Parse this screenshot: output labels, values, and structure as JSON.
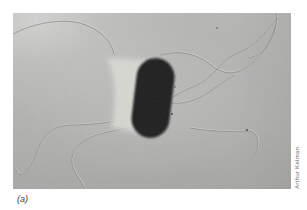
{
  "figure": {
    "panel_label": "(a)",
    "credit": "Arthur Kelman",
    "colors": {
      "page_background": "#ffffff",
      "micrograph_background": "#c7c7c5",
      "cell_body": "#141412",
      "halo": "#efefe9",
      "flagella": "#8a8a84",
      "credit_text": "#6b6b68",
      "label_text": "#3a3a38"
    }
  }
}
